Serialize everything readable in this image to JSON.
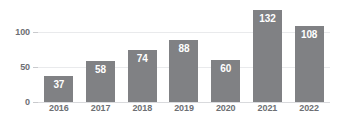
{
  "chart_data": {
    "type": "bar",
    "title": "",
    "subtitle": "",
    "xlabel": "",
    "ylabel": "",
    "categories": [
      "2016",
      "2017",
      "2018",
      "2019",
      "2020",
      "2021",
      "2022"
    ],
    "values": [
      37,
      58,
      74,
      88,
      60,
      132,
      108
    ],
    "value_labels": [
      "37",
      "58",
      "74",
      "88",
      "60",
      "132",
      "108"
    ],
    "ylim": [
      0,
      140
    ],
    "yticks": [
      0,
      50,
      100
    ],
    "ytick_labels": [
      "0",
      "50",
      "100"
    ],
    "grid": true,
    "legend": false,
    "legend_position": "none",
    "bar_color": "#808184",
    "value_label_color": "#ffffff",
    "gridline_color": "#e9eaec",
    "axis_text_color": "#6d6f73",
    "background_color": "#ffffff"
  }
}
